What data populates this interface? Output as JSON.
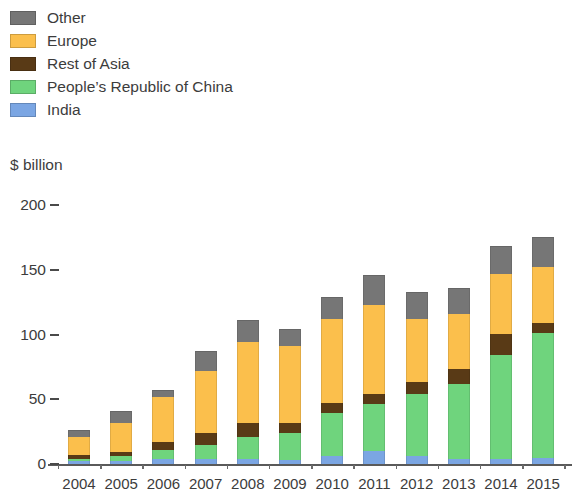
{
  "legend": {
    "items": [
      {
        "label": "Other",
        "color": "#767676"
      },
      {
        "label": "Europe",
        "color": "#fbbf4c"
      },
      {
        "label": "Rest of Asia",
        "color": "#593a16"
      },
      {
        "label": "People’s Republic of China",
        "color": "#6fd47d"
      },
      {
        "label": "India",
        "color": "#7ba6e3"
      }
    ]
  },
  "chart_data": {
    "type": "bar",
    "stacked": true,
    "title": "",
    "subtitle": "",
    "xlabel": "",
    "ylabel": "$ billion",
    "ylim": [
      0,
      200
    ],
    "yticks": [
      0,
      50,
      100,
      150,
      200
    ],
    "ytick_labels": [
      "0",
      "50",
      "100",
      "150",
      "200"
    ],
    "grid": false,
    "legend_position": "top-left",
    "categories": [
      "2004",
      "2005",
      "2006",
      "2007",
      "2008",
      "2009",
      "2010",
      "2011",
      "2012",
      "2013",
      "2014",
      "2015"
    ],
    "series": [
      {
        "name": "India",
        "color": "#7ba6e3",
        "values": [
          2,
          2,
          4,
          4,
          4,
          3,
          6,
          10,
          6,
          4,
          4,
          5
        ]
      },
      {
        "name": "People’s Republic of China",
        "color": "#6fd47d",
        "values": [
          2,
          4,
          7,
          11,
          17,
          21,
          33,
          36,
          48,
          58,
          80,
          96
        ]
      },
      {
        "name": "Rest of Asia",
        "color": "#593a16",
        "values": [
          3,
          3,
          6,
          9,
          11,
          8,
          8,
          8,
          9,
          11,
          16,
          8
        ]
      },
      {
        "name": "Europe",
        "color": "#fbbf4c",
        "values": [
          14,
          23,
          35,
          48,
          62,
          59,
          65,
          69,
          49,
          43,
          47,
          43
        ]
      },
      {
        "name": "Other",
        "color": "#767676",
        "values": [
          5,
          9,
          5,
          15,
          17,
          13,
          17,
          23,
          21,
          20,
          21,
          23
        ]
      }
    ],
    "totals": [
      26,
      41,
      57,
      87,
      111,
      104,
      129,
      146,
      133,
      136,
      168,
      175
    ]
  },
  "axis": {
    "unit_label": "$ billion"
  }
}
